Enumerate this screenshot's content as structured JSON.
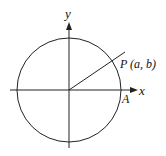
{
  "diagram": {
    "type": "unit-circle",
    "axes": {
      "x_label": "x",
      "y_label": "y"
    },
    "points": [
      {
        "name": "P",
        "label": "P (a, b)"
      },
      {
        "name": "A",
        "label": "A"
      }
    ],
    "colors": {
      "stroke": "#222222",
      "background": "#ffffff"
    }
  }
}
